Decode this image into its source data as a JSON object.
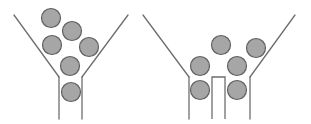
{
  "diagram": {
    "colors": {
      "line": "#6e6e6e",
      "particle_fill": "#a6a6a6",
      "particle_stroke": "#5f5f5f",
      "background": "#ffffff"
    },
    "left_funnel": {
      "walls": [
        {
          "x1": 14,
          "y1": 15,
          "x2": 59,
          "y2": 77
        },
        {
          "x1": 59,
          "y1": 77,
          "x2": 59,
          "y2": 119
        },
        {
          "x1": 128,
          "y1": 15,
          "x2": 82,
          "y2": 77
        },
        {
          "x1": 82,
          "y1": 77,
          "x2": 82,
          "y2": 119
        }
      ],
      "particles": [
        {
          "cx": 51,
          "cy": 18,
          "r": 9.5
        },
        {
          "cx": 72,
          "cy": 31,
          "r": 9.5
        },
        {
          "cx": 52,
          "cy": 45,
          "r": 9.5
        },
        {
          "cx": 89,
          "cy": 47,
          "r": 9.5
        },
        {
          "cx": 70,
          "cy": 66,
          "r": 9.5
        },
        {
          "cx": 71,
          "cy": 92,
          "r": 9.5
        }
      ]
    },
    "right_funnel": {
      "walls": [
        {
          "x1": 143,
          "y1": 15,
          "x2": 189,
          "y2": 77
        },
        {
          "x1": 189,
          "y1": 77,
          "x2": 189,
          "y2": 119
        },
        {
          "x1": 295,
          "y1": 15,
          "x2": 250,
          "y2": 77
        },
        {
          "x1": 250,
          "y1": 77,
          "x2": 250,
          "y2": 119
        }
      ],
      "divider": {
        "x_left": 212,
        "x_right": 225,
        "y_top": 77,
        "y_bottom": 119
      },
      "particles": [
        {
          "cx": 221,
          "cy": 45,
          "r": 9.5
        },
        {
          "cx": 256,
          "cy": 48,
          "r": 9.5
        },
        {
          "cx": 200,
          "cy": 66,
          "r": 9.5
        },
        {
          "cx": 237,
          "cy": 66,
          "r": 9.5
        },
        {
          "cx": 200,
          "cy": 90,
          "r": 9.5
        },
        {
          "cx": 237,
          "cy": 90,
          "r": 9.5
        }
      ]
    }
  }
}
